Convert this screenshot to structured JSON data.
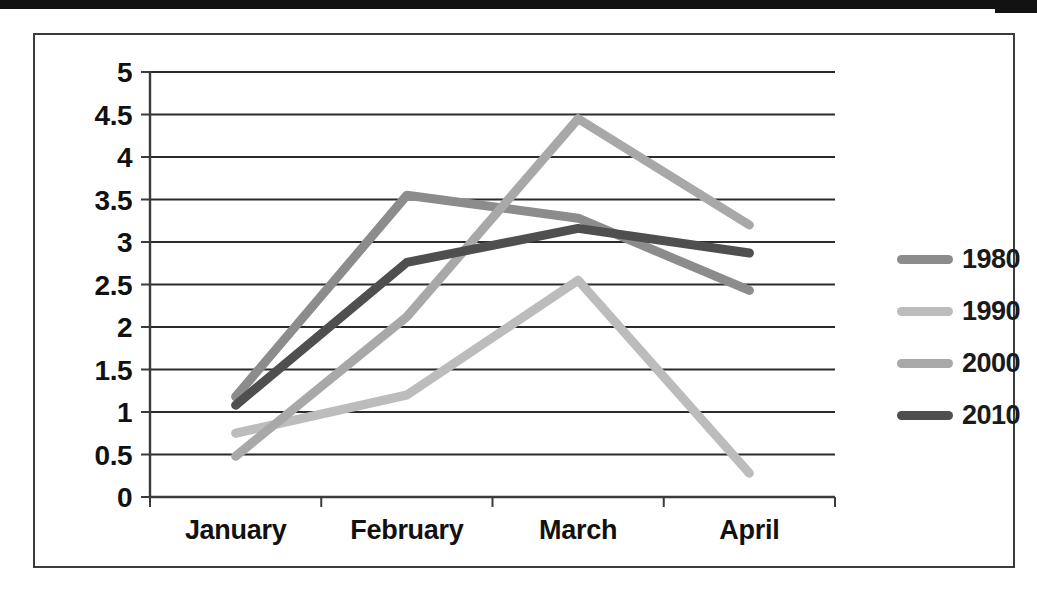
{
  "chart_data": {
    "type": "line",
    "title": "",
    "xlabel": "",
    "ylabel": "",
    "categories": [
      "January",
      "February",
      "March",
      "April"
    ],
    "ylim": [
      0,
      5
    ],
    "ytick_labels": [
      "5",
      "4.5",
      "4",
      "3.5",
      "3",
      "2.5",
      "2",
      "1.5",
      "1",
      "0.5",
      "0"
    ],
    "ytick_values": [
      5,
      4.5,
      4,
      3.5,
      3,
      2.5,
      2,
      1.5,
      1,
      0.5,
      0
    ],
    "grid": true,
    "legend_position": "right",
    "series": [
      {
        "name": "1980",
        "color": "#8c8c8c",
        "values": [
          1.18,
          3.55,
          3.28,
          2.43
        ]
      },
      {
        "name": "1990",
        "color": "#bcbcbc",
        "values": [
          0.75,
          1.2,
          2.55,
          0.28
        ]
      },
      {
        "name": "2000",
        "color": "#a8a8a8",
        "values": [
          0.48,
          2.12,
          4.45,
          3.2
        ]
      },
      {
        "name": "2010",
        "color": "#4f4f4f",
        "values": [
          1.08,
          2.76,
          3.16,
          2.87
        ]
      }
    ]
  },
  "axis": {
    "y_axis_name": "value-axis",
    "x_axis_name": "category-axis"
  },
  "legend": {
    "entries": [
      {
        "label": "1980",
        "color": "#8c8c8c"
      },
      {
        "label": "1990",
        "color": "#bcbcbc"
      },
      {
        "label": "2000",
        "color": "#a8a8a8"
      },
      {
        "label": "2010",
        "color": "#4f4f4f"
      }
    ]
  },
  "colors": {
    "frame": "#3b3b3b",
    "axis": "#3b3b3b",
    "gridline": "#2b2b2b",
    "tick_label": "#111111",
    "background": "#ffffff",
    "scan_bar": "#121212"
  }
}
